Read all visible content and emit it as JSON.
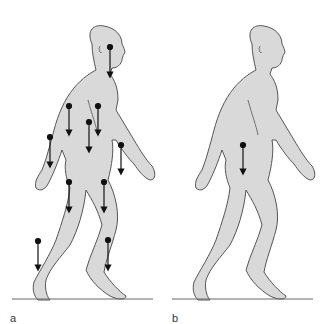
{
  "figure": {
    "panels": [
      {
        "label": "a",
        "description": "walking figure with segment centers of mass and downward force arrows",
        "arrow_count": 11
      },
      {
        "label": "b",
        "description": "walking figure with single whole-body center of mass and downward arrow",
        "arrow_count": 1
      }
    ],
    "colors": {
      "body_fill": "#d9d9d9",
      "outline": "#555555",
      "arrow": "#111111",
      "ground": "#666666"
    }
  }
}
